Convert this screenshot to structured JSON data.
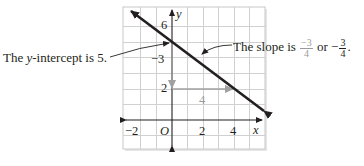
{
  "figure": {
    "type": "coordinate-graph",
    "axes": {
      "x_label": "x",
      "y_label": "y",
      "origin_label": "O",
      "x_ticks": [
        "−2",
        "2",
        "4"
      ],
      "y_ticks": [
        "6",
        "2"
      ]
    },
    "line": {
      "slope": "-3/4",
      "y_intercept": 5
    },
    "slope_triangle": {
      "rise_label": "−3",
      "run_label": "4"
    },
    "annotations": {
      "intercept": {
        "prefix": "The ",
        "var": "y",
        "suffix": "-intercept is 5."
      },
      "slope": {
        "text": "The slope is ",
        "frac1_num": "−3",
        "frac1_den": "4",
        "or": " or ",
        "neg": "−",
        "frac2_num": "3",
        "frac2_den": "4",
        "end": "."
      }
    },
    "colors": {
      "grid": "#d0d0d0",
      "axis": "#231f20",
      "line": "#231f20",
      "slope_triangle": "#a0a0a0",
      "frame_shadow": "#c8c8c8"
    }
  }
}
